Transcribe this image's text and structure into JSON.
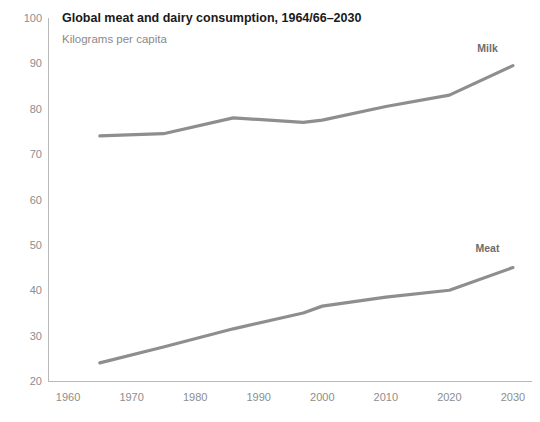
{
  "chart_data": {
    "type": "line",
    "title": "Global meat and dairy consumption, 1964/66–2030",
    "subtitle": "Kilograms per capita",
    "xlabel": "",
    "ylabel": "",
    "xlim": [
      1957,
      2033
    ],
    "ylim": [
      20,
      100
    ],
    "xticks": [
      1960,
      1970,
      1980,
      1990,
      2000,
      2010,
      2020,
      2030
    ],
    "xtick_labels": [
      "1960",
      "1970",
      "1980",
      "1990",
      "2000",
      "2010",
      "2020",
      "2030"
    ],
    "yticks": [
      20,
      30,
      40,
      50,
      60,
      70,
      80,
      90,
      100
    ],
    "ytick_labels": [
      "20",
      "30",
      "40",
      "50",
      "60",
      "70",
      "80",
      "90",
      "100"
    ],
    "grid": false,
    "legend_position": "inline-end-of-line",
    "line_color": "#8e8e8e",
    "series": [
      {
        "name": "Milk",
        "label": "Milk",
        "color": "#8e8e8e",
        "x": [
          1965,
          1975,
          1986,
          1997,
          2000,
          2010,
          2020,
          2030
        ],
        "values": [
          74,
          74.5,
          78,
          77,
          77.5,
          80.5,
          83,
          89.5
        ]
      },
      {
        "name": "Meat",
        "label": "Meat",
        "color": "#8e8e8e",
        "x": [
          1965,
          1975,
          1986,
          1997,
          2000,
          2010,
          2020,
          2030
        ],
        "values": [
          24,
          27.5,
          31.5,
          35,
          36.5,
          38.5,
          40,
          45
        ]
      }
    ],
    "annotations": [
      {
        "text": "Milk",
        "x": 2026,
        "y": 92.5
      },
      {
        "text": "Meat",
        "x": 2026,
        "y": 48.5
      }
    ]
  }
}
